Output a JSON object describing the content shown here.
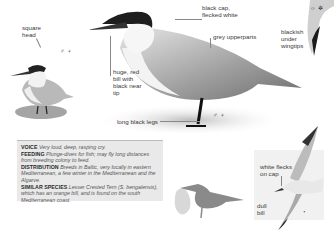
{
  "labels": {
    "square_head": "square\nhead",
    "black_cap": "black cap,\nflecked white",
    "grey_upperparts": "grey upperparts",
    "blackish_wingtips": "blackish\nunder\nwingtips",
    "huge_bill": "huge, red\nbill with\nblack near\ntip",
    "long_legs": "long black legs",
    "white_flecks": "white flecks\non cap",
    "dull_bill": "dull\nbill"
  },
  "symbols": {
    "small_bird": "♂ ♀",
    "main_bird": "♂ ♀",
    "flight_top": "☼ ✲",
    "flight_bird": "◔"
  },
  "info": {
    "voice_head": "VOICE",
    "voice_text": "Very loud, deep, rasping cry.",
    "feeding_head": "FEEDING",
    "feeding_text": "Plunge-dives for fish; may fly long distances from breeding colony to feed.",
    "distribution_head": "DISTRIBUTION",
    "distribution_text": "Breeds in Baltic, very locally in eastern Mediterranean, a few winter in the Mediterranean and the Algarve.",
    "similar_head": "SIMILAR SPECIES",
    "similar_text_1": "Lesser Crested Tern",
    "similar_text_2": "(S. bengalensis), which has an orange bill, and is found on the south Mediterranean coast."
  },
  "colors": {
    "panel_bg": "#e9e9ea",
    "silhouette_dark": "#8a8a8a",
    "silhouette_light": "#d6d6d6"
  }
}
